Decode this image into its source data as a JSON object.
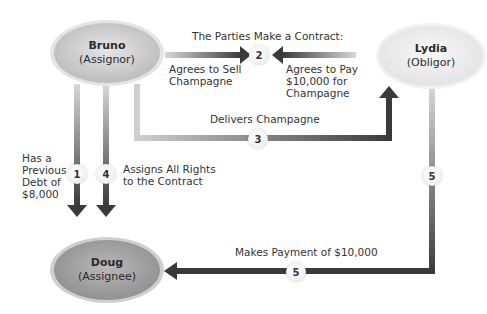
{
  "title": "The Parties Make a Contract:",
  "parties": {
    "bruno": {
      "name": "Bruno",
      "role": "(Assignor)"
    },
    "lydia": {
      "name": "Lydia",
      "role": "(Obligor)"
    },
    "doug": {
      "name": "Doug",
      "role": "(Assignee)"
    }
  },
  "steps": {
    "s1": {
      "number": "1",
      "label_lines": [
        "Has a",
        "Previous",
        "Debt of",
        "$8,000"
      ]
    },
    "s2_left": {
      "label_lines": [
        "Agrees to Sell",
        "Champagne"
      ]
    },
    "s2": {
      "number": "2"
    },
    "s2_right": {
      "label_lines": [
        "Agrees to Pay",
        "$10,000 for",
        "Champagne"
      ]
    },
    "s3": {
      "number": "3",
      "label": "Delivers Champagne"
    },
    "s4": {
      "number": "4",
      "label_lines": [
        "Assigns All Rights",
        "to the Contract"
      ]
    },
    "s5_vertical": {
      "number": "5"
    },
    "s5": {
      "number": "5",
      "label": "Makes Payment of $10,000"
    }
  },
  "colors": {
    "arrow_dark": "#3a3a3a",
    "arrow_light": "#d8d8d8",
    "bruno_fill": "#cfcfcf",
    "lydia_fill": "#eeeeee",
    "doug_fill": "#a3a3a3"
  }
}
